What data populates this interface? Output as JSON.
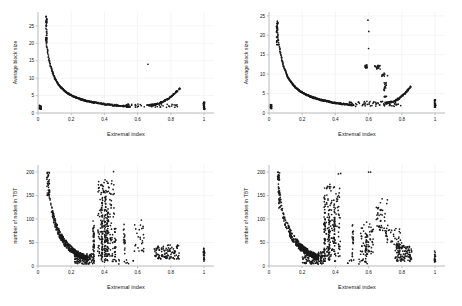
{
  "figure": {
    "background": "#ffffff",
    "point_color": "#1a1a1a",
    "axis_color": "#b9b9b9",
    "grid_color": "#f0f0f0",
    "panel_count": 4
  },
  "chart_data": [
    {
      "id": "top-left",
      "type": "scatter",
      "title": "",
      "xlabel": "Extremal index",
      "ylabel": "Average block size",
      "xlim": [
        0,
        1.06
      ],
      "ylim": [
        0,
        29
      ],
      "xticks": [
        0,
        0.2,
        0.4,
        0.6,
        0.8,
        1
      ],
      "xticklabels": [
        "0",
        "0.2",
        "0.4",
        "0.6",
        "0.8",
        "1"
      ],
      "yticks": [
        0,
        5,
        10,
        15,
        20,
        25
      ],
      "yticklabels": [
        "0",
        "5",
        "10",
        "15",
        "20",
        "25"
      ],
      "grid": true,
      "legend": "none",
      "seed": 11,
      "clusters": [
        {
          "kind": "vstripe",
          "x": 0.013,
          "xjit": 0.006,
          "y0": 1.0,
          "y1": 2.4,
          "n": 26
        },
        {
          "kind": "vstripe",
          "x": 0.05,
          "xjit": 0.004,
          "y0": 20.0,
          "y1": 28.3,
          "n": 42
        },
        {
          "kind": "curve",
          "x0": 0.052,
          "x1": 0.34,
          "n": 240,
          "a": 1.02,
          "b": 0.0,
          "yjit": 0.16
        },
        {
          "kind": "curve",
          "x0": 0.34,
          "x1": 0.55,
          "n": 90,
          "a": 1.02,
          "b": 0.0,
          "yjit": 0.22
        },
        {
          "kind": "scatter-band",
          "x0": 0.52,
          "x1": 0.84,
          "y0": 1.6,
          "y1": 2.6,
          "n": 55
        },
        {
          "kind": "uptail",
          "x0": 0.66,
          "x1": 0.855,
          "n": 110,
          "ya": 2.2,
          "yb": 7.2,
          "yjit": 0.22
        },
        {
          "kind": "point",
          "x": 0.662,
          "y": 14.0
        },
        {
          "kind": "vstripe",
          "x": 1.0,
          "xjit": 0.0035,
          "y0": 1.0,
          "y1": 3.1,
          "n": 30
        }
      ]
    },
    {
      "id": "top-right",
      "type": "scatter",
      "title": "",
      "xlabel": "Extremal index",
      "ylabel": "Average block size",
      "xlim": [
        0,
        1.06
      ],
      "ylim": [
        0,
        26
      ],
      "xticks": [
        0,
        0.2,
        0.4,
        0.6,
        0.8,
        1
      ],
      "xticklabels": [
        "0",
        "0.2",
        "0.4",
        "0.6",
        "0.8",
        "1"
      ],
      "yticks": [
        0,
        5,
        10,
        15,
        20,
        25
      ],
      "yticklabels": [
        "0",
        "5",
        "10",
        "15",
        "20",
        "25"
      ],
      "grid": true,
      "legend": "none",
      "seed": 27,
      "clusters": [
        {
          "kind": "vstripe",
          "x": 0.012,
          "xjit": 0.005,
          "y0": 1.1,
          "y1": 2.2,
          "n": 18
        },
        {
          "kind": "vstripe",
          "x": 0.049,
          "xjit": 0.004,
          "y0": 17.2,
          "y1": 23.7,
          "n": 34
        },
        {
          "kind": "curve",
          "x0": 0.052,
          "x1": 0.36,
          "n": 250,
          "a": 1.06,
          "b": 0.0,
          "yjit": 0.16
        },
        {
          "kind": "curve",
          "x0": 0.36,
          "x1": 0.5,
          "n": 70,
          "a": 1.04,
          "b": 0.0,
          "yjit": 0.2
        },
        {
          "kind": "scatter-band",
          "x0": 0.47,
          "x1": 0.8,
          "y0": 1.7,
          "y1": 3.0,
          "n": 70
        },
        {
          "kind": "uptail",
          "x0": 0.7,
          "x1": 0.855,
          "n": 95,
          "ya": 2.6,
          "yb": 6.9,
          "yjit": 0.22
        },
        {
          "kind": "vstripe",
          "x": 0.585,
          "xjit": 0.006,
          "y0": 11.4,
          "y1": 12.4,
          "n": 14
        },
        {
          "kind": "point",
          "x": 0.596,
          "y": 23.9
        },
        {
          "kind": "point",
          "x": 0.601,
          "y": 21.0
        },
        {
          "kind": "point",
          "x": 0.6,
          "y": 16.6
        },
        {
          "kind": "blob",
          "x": 0.655,
          "y": 11.8,
          "xr": 0.018,
          "yr": 0.5,
          "n": 16
        },
        {
          "kind": "blob",
          "x": 0.686,
          "y": 9.9,
          "xr": 0.012,
          "yr": 0.45,
          "n": 10
        },
        {
          "kind": "point",
          "x": 0.714,
          "y": 9.6
        },
        {
          "kind": "vstripe",
          "x": 0.7,
          "xjit": 0.008,
          "y0": 4.0,
          "y1": 8.0,
          "n": 18
        },
        {
          "kind": "vstripe",
          "x": 1.0,
          "xjit": 0.0035,
          "y0": 1.5,
          "y1": 3.4,
          "n": 26
        }
      ]
    },
    {
      "id": "bottom-left",
      "type": "scatter",
      "title": "",
      "xlabel": "Extremal index",
      "ylabel": "number of nodes in TBT",
      "xlim": [
        0,
        1.06
      ],
      "ylim": [
        0,
        215
      ],
      "xticks": [
        0,
        0.2,
        0.4,
        0.6,
        0.8,
        1
      ],
      "xticklabels": [
        "0",
        "0.2",
        "0.4",
        "0.6",
        "0.8",
        "1"
      ],
      "yticks": [
        0,
        50,
        100,
        150,
        200
      ],
      "yticklabels": [
        "0",
        "50",
        "100",
        "150",
        "200"
      ],
      "grid": true,
      "legend": "none",
      "seed": 43,
      "clusters": [
        {
          "kind": "vstripe",
          "x": 0.062,
          "xjit": 0.008,
          "y0": 150,
          "y1": 201,
          "n": 34
        },
        {
          "kind": "decay",
          "x0": 0.055,
          "x1": 0.3,
          "n": 420,
          "ya": 200,
          "yb": 16,
          "yjit": 10
        },
        {
          "kind": "scatter-band",
          "x0": 0.22,
          "x1": 0.34,
          "y0": 4,
          "y1": 26,
          "n": 120
        },
        {
          "kind": "vstripe",
          "x": 0.335,
          "xjit": 0.004,
          "y0": 8,
          "y1": 100,
          "n": 40
        },
        {
          "kind": "vstripe",
          "x": 0.385,
          "xjit": 0.004,
          "y0": 6,
          "y1": 145,
          "n": 46
        },
        {
          "kind": "vstripe",
          "x": 0.405,
          "xjit": 0.005,
          "y0": 8,
          "y1": 160,
          "n": 52
        },
        {
          "kind": "vstripe",
          "x": 0.418,
          "xjit": 0.005,
          "y0": 6,
          "y1": 120,
          "n": 44
        },
        {
          "kind": "cloud",
          "x0": 0.36,
          "x1": 0.46,
          "y0": 20,
          "y1": 185,
          "n": 150
        },
        {
          "kind": "vstripe",
          "x": 0.465,
          "xjit": 0.004,
          "y0": 20,
          "y1": 80,
          "n": 22
        },
        {
          "kind": "vstripe",
          "x": 0.52,
          "xjit": 0.006,
          "y0": 25,
          "y1": 90,
          "n": 18
        },
        {
          "kind": "point",
          "x": 0.455,
          "y": 201
        },
        {
          "kind": "cloud",
          "x0": 0.58,
          "x1": 0.64,
          "y0": 30,
          "y1": 100,
          "n": 26
        },
        {
          "kind": "cloud",
          "x0": 0.7,
          "x1": 0.85,
          "y0": 15,
          "y1": 45,
          "n": 110
        },
        {
          "kind": "scatter-band",
          "x0": 0.44,
          "x1": 0.58,
          "y0": 4,
          "y1": 14,
          "n": 16
        },
        {
          "kind": "vstripe",
          "x": 1.0,
          "xjit": 0.004,
          "y0": 6,
          "y1": 38,
          "n": 22
        }
      ]
    },
    {
      "id": "bottom-right",
      "type": "scatter",
      "title": "",
      "xlabel": "Extremal index",
      "ylabel": "number of nodes in TBT",
      "xlim": [
        0,
        1.06
      ],
      "ylim": [
        0,
        215
      ],
      "xticks": [
        0,
        0.2,
        0.4,
        0.6,
        0.8,
        1
      ],
      "xticklabels": [
        "0",
        "0.2",
        "0.4",
        "0.6",
        "0.8",
        "1"
      ],
      "yticks": [
        0,
        50,
        100,
        150,
        200
      ],
      "yticklabels": [
        "0",
        "50",
        "100",
        "150",
        "200"
      ],
      "grid": true,
      "legend": "none",
      "seed": 91,
      "clusters": [
        {
          "kind": "vstripe",
          "x": 0.058,
          "xjit": 0.006,
          "y0": 182,
          "y1": 202,
          "n": 20
        },
        {
          "kind": "vstripe",
          "x": 0.062,
          "xjit": 0.007,
          "y0": 120,
          "y1": 175,
          "n": 26
        },
        {
          "kind": "decay",
          "x0": 0.055,
          "x1": 0.3,
          "n": 430,
          "ya": 185,
          "yb": 18,
          "yjit": 11
        },
        {
          "kind": "scatter-band",
          "x0": 0.2,
          "x1": 0.33,
          "y0": 4,
          "y1": 30,
          "n": 130
        },
        {
          "kind": "vstripe",
          "x": 0.335,
          "xjit": 0.004,
          "y0": 10,
          "y1": 150,
          "n": 46
        },
        {
          "kind": "vstripe",
          "x": 0.362,
          "xjit": 0.004,
          "y0": 10,
          "y1": 120,
          "n": 40
        },
        {
          "kind": "vstripe",
          "x": 0.395,
          "xjit": 0.005,
          "y0": 8,
          "y1": 135,
          "n": 42
        },
        {
          "kind": "cloud",
          "x0": 0.33,
          "x1": 0.43,
          "y0": 20,
          "y1": 175,
          "n": 120
        },
        {
          "kind": "point",
          "x": 0.335,
          "y": 166
        },
        {
          "kind": "vstripe",
          "x": 0.505,
          "xjit": 0.004,
          "y0": 20,
          "y1": 88,
          "n": 20
        },
        {
          "kind": "point",
          "x": 0.418,
          "y": 196
        },
        {
          "kind": "point",
          "x": 0.432,
          "y": 197
        },
        {
          "kind": "point",
          "x": 0.6,
          "y": 200
        },
        {
          "kind": "point",
          "x": 0.612,
          "y": 200
        },
        {
          "kind": "cloud",
          "x0": 0.55,
          "x1": 0.63,
          "y0": 25,
          "y1": 95,
          "n": 55
        },
        {
          "kind": "vstripe",
          "x": 0.585,
          "xjit": 0.005,
          "y0": 20,
          "y1": 70,
          "n": 22
        },
        {
          "kind": "cloud",
          "x0": 0.645,
          "x1": 0.72,
          "y0": 75,
          "y1": 145,
          "n": 40
        },
        {
          "kind": "cloud",
          "x0": 0.7,
          "x1": 0.8,
          "y0": 45,
          "y1": 80,
          "n": 36
        },
        {
          "kind": "cloud",
          "x0": 0.76,
          "x1": 0.86,
          "y0": 10,
          "y1": 45,
          "n": 120
        },
        {
          "kind": "scatter-band",
          "x0": 0.44,
          "x1": 0.6,
          "y0": 4,
          "y1": 16,
          "n": 18
        },
        {
          "kind": "vstripe",
          "x": 1.0,
          "xjit": 0.004,
          "y0": 8,
          "y1": 32,
          "n": 18
        }
      ]
    }
  ]
}
